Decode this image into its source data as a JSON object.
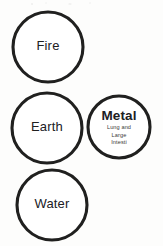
{
  "figure": {
    "kind": "five-element-cycle-diagram",
    "background_color": "#fdfdfc",
    "ink_color": "#20201f",
    "width": 163,
    "height": 246
  },
  "nodes": [
    {
      "id": "fire",
      "label": "Fire",
      "sublabel": "",
      "label_weight": "plain",
      "cx": 48,
      "cy": 47,
      "r": 35,
      "stroke_width": 3.1
    },
    {
      "id": "earth",
      "label": "Earth",
      "sublabel": "",
      "label_weight": "plain",
      "cx": 47,
      "cy": 128,
      "r": 35,
      "stroke_width": 3.1
    },
    {
      "id": "water",
      "label": "Water",
      "sublabel": "",
      "label_weight": "plain",
      "cx": 52,
      "cy": 205,
      "r": 35,
      "stroke_width": 3.1
    },
    {
      "id": "metal",
      "label": "Metal",
      "sublabel_lines": [
        "Lung and",
        "Large",
        "Intesti"
      ],
      "label_weight": "strong",
      "cx": 119,
      "cy": 127,
      "r": 31,
      "stroke_width": 3.1
    }
  ],
  "edges": [
    {
      "id": "fire-to-metal",
      "from": "fire",
      "to": "metal",
      "label": "",
      "x1": 75,
      "y1": 71,
      "x2": 103,
      "y2": 104,
      "stroke_width": 3.4,
      "head_size": 8.5
    },
    {
      "id": "earth-to-metal",
      "from": "earth",
      "to": "metal",
      "label": "",
      "x1": 80,
      "y1": 120,
      "x2": 92,
      "y2": 120,
      "stroke_width": 3.4,
      "head_size": 8.0
    },
    {
      "id": "metal-to-water",
      "from": "metal",
      "to": "water",
      "label": "",
      "x1": 105,
      "y1": 152,
      "x2": 79,
      "y2": 176,
      "stroke_width": 3.4,
      "head_size": 8.5
    }
  ]
}
